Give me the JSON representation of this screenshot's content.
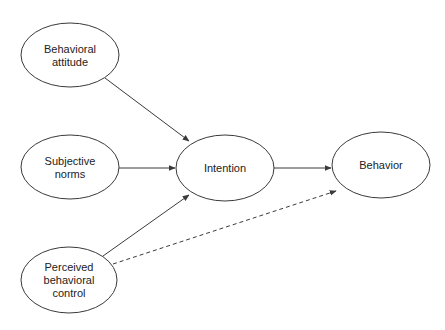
{
  "diagram": {
    "nodes": [
      {
        "id": "attitude",
        "lines": [
          "Behavioral",
          "attitude"
        ]
      },
      {
        "id": "norms",
        "lines": [
          "Subjective",
          "norms"
        ]
      },
      {
        "id": "control",
        "lines": [
          "Perceived",
          "behavioral",
          "control"
        ]
      },
      {
        "id": "intention",
        "lines": [
          "Intention"
        ]
      },
      {
        "id": "behavior",
        "lines": [
          "Behavior"
        ]
      }
    ],
    "edges": [
      {
        "from": "attitude",
        "to": "intention",
        "style": "solid"
      },
      {
        "from": "norms",
        "to": "intention",
        "style": "solid"
      },
      {
        "from": "control",
        "to": "intention",
        "style": "solid"
      },
      {
        "from": "intention",
        "to": "behavior",
        "style": "solid"
      },
      {
        "from": "control",
        "to": "behavior",
        "style": "dashed"
      }
    ],
    "colors": {
      "stroke": "#3a3a3a",
      "text": "#222222",
      "background": "#ffffff"
    }
  }
}
